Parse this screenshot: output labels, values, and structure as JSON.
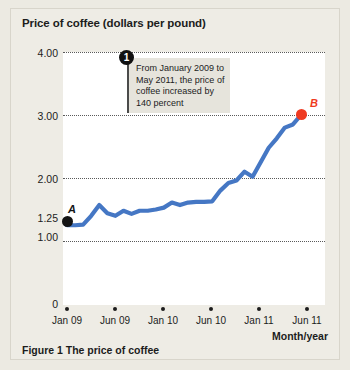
{
  "figure": {
    "caption": "Figure 1  The price of coffee"
  },
  "chart_data": {
    "type": "line",
    "title": "Price of coffee (dollars per pound)",
    "xlabel": "Month/year",
    "ylabel": "Price of coffee (dollars per pound)",
    "ylim": [
      0,
      4.0
    ],
    "grid": true,
    "legend": "none",
    "ytick_labels": [
      "4.00",
      "3.00",
      "2.00",
      "1.25",
      "1.00",
      "0"
    ],
    "ytick_values": [
      4.0,
      3.0,
      2.0,
      1.25,
      1.0,
      0
    ],
    "gridline_values": [
      4.0,
      3.0,
      2.0,
      1.0
    ],
    "categories": [
      "Jan 09",
      "Jun 09",
      "Jan 10",
      "Jun 10",
      "Jan 11",
      "Jun 11"
    ],
    "xtick_values": [
      0,
      5,
      12,
      17,
      24,
      29
    ],
    "series": [
      {
        "name": "Price of coffee",
        "color": "#4577c4",
        "x": [
          0,
          1,
          2,
          3,
          4,
          5,
          6,
          7,
          8,
          9,
          10,
          11,
          12,
          13,
          14,
          15,
          16,
          17,
          18,
          19,
          20,
          21,
          22,
          23,
          24,
          25,
          26,
          27,
          28,
          29
        ],
        "values": [
          1.25,
          1.25,
          1.26,
          1.4,
          1.57,
          1.44,
          1.4,
          1.48,
          1.43,
          1.48,
          1.48,
          1.5,
          1.53,
          1.61,
          1.57,
          1.61,
          1.62,
          1.62,
          1.63,
          1.8,
          1.92,
          1.96,
          2.1,
          2.02,
          2.25,
          2.48,
          2.63,
          2.8,
          2.85,
          3.0
        ]
      }
    ],
    "points": [
      {
        "label": "A",
        "x": 0,
        "value": 1.25,
        "color": "#141414",
        "date": "Jan 09"
      },
      {
        "label": "B",
        "x": 29,
        "value": 3.0,
        "color": "#ef3a21",
        "date": "May 11"
      }
    ],
    "annotations": [
      {
        "badge": "1",
        "text": "From January 2009 to May 2011, the price of coffee increased by 140 percent"
      }
    ]
  }
}
